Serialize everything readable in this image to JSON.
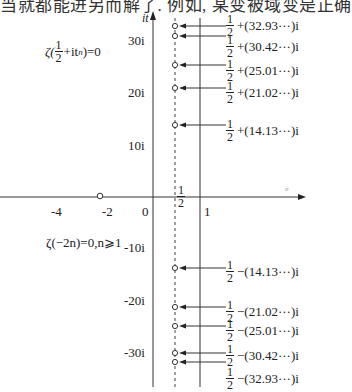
{
  "top_text": "当就都能进另而解了. 例如, 某变被域变是正确",
  "axes": {
    "imag_axis_label": "it",
    "real_axis_label": "σ",
    "imag_ticks": [
      {
        "label": "30i",
        "y": 40
      },
      {
        "label": "20i",
        "y": 92
      },
      {
        "label": "10i",
        "y": 145
      },
      {
        "label": "-10i",
        "y": 247
      },
      {
        "label": "-20i",
        "y": 300
      },
      {
        "label": "-30i",
        "y": 352
      }
    ],
    "real_ticks": [
      {
        "label": "-4",
        "x": 57
      },
      {
        "label": "-2",
        "x": 106
      },
      {
        "label": "0",
        "x": 145
      },
      {
        "label": "1",
        "x": 206
      }
    ],
    "half_label_num": "1",
    "half_label_den": "2"
  },
  "formulas": {
    "critical_line": {
      "prefix": "ζ(",
      "num": "1",
      "den": "2",
      "suffix": "+it",
      "sub": "n",
      "end": ")=0"
    },
    "trivial_zeros": "ζ(−2n)=0,n⩾1"
  },
  "nontrivial_zeros": [
    {
      "sign": "+",
      "value": "(32.93···)i",
      "y": 26
    },
    {
      "sign": "+",
      "value": "(30.42···)i",
      "y": 36
    },
    {
      "sign": "+",
      "value": "(25.01···)i",
      "y": 65
    },
    {
      "sign": "+",
      "value": "(21.02···)i",
      "y": 88
    },
    {
      "sign": "+",
      "value": "(14.13···)i",
      "y": 125
    },
    {
      "sign": "−",
      "value": "(14.13···)i",
      "y": 268
    },
    {
      "sign": "−",
      "value": "(21.02···)i",
      "y": 307
    },
    {
      "sign": "−",
      "value": "(25.01···)i",
      "y": 326
    },
    {
      "sign": "−",
      "value": "(30.42···)i",
      "y": 353
    },
    {
      "sign": "−",
      "value": "(32.93···)i",
      "y": 362
    }
  ],
  "zero_labels": [
    {
      "num": "1",
      "den": "2",
      "rest": "+(32.93···)i",
      "top": 13
    },
    {
      "num": "1",
      "den": "2",
      "rest": "+(30.42···)i",
      "top": 34
    },
    {
      "num": "1",
      "den": "2",
      "rest": "+(25.01···)i",
      "top": 58
    },
    {
      "num": "1",
      "den": "2",
      "rest": "+(21.02···)i",
      "top": 80
    },
    {
      "num": "1",
      "den": "2",
      "rest": "+(14.13···)i",
      "top": 118
    },
    {
      "num": "1",
      "den": "2",
      "rest": "−(14.13···)i",
      "top": 259
    },
    {
      "num": "1",
      "den": "2",
      "rest": "−(21.02···)i",
      "top": 299
    },
    {
      "num": "1",
      "den": "2",
      "rest": "−(25.01···)i",
      "top": 318
    },
    {
      "num": "1",
      "den": "2",
      "rest": "−(30.42···)i",
      "top": 343
    },
    {
      "num": "1",
      "den": "2",
      "rest": "−(32.93···)i",
      "top": 366
    }
  ],
  "trivial_zero_marker": {
    "x": 100,
    "y": 196
  }
}
